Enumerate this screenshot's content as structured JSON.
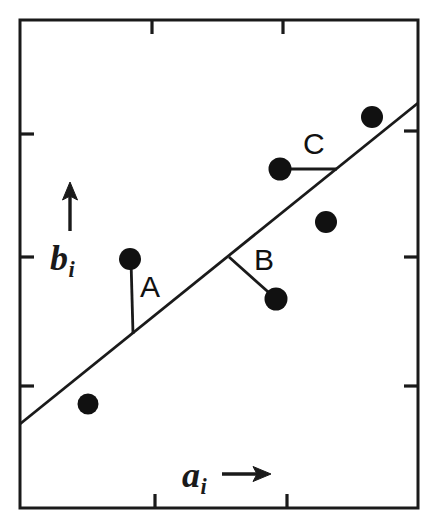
{
  "figure": {
    "title": "",
    "background_color": "#ffffff",
    "ink_color": "#1a1a1a",
    "width": 435,
    "height": 527
  },
  "axes": {
    "x_label_text": "a",
    "x_label_subscript": "i",
    "x_arrow_icon": "right-arrow-icon",
    "y_label_text": "b",
    "y_label_subscript": "i",
    "y_arrow_icon": "up-arrow-icon"
  },
  "annotations": [
    {
      "id": "A",
      "label": "A"
    },
    {
      "id": "B",
      "label": "B"
    },
    {
      "id": "C",
      "label": "C"
    }
  ],
  "chart_data": {
    "type": "scatter",
    "title": "",
    "xlabel": "a_i",
    "ylabel": "b_i",
    "grid": false,
    "legend": null,
    "axis_ticks_unlabeled": true,
    "xlim": [
      0,
      100
    ],
    "ylim": [
      0,
      100
    ],
    "x_ticks": [
      34,
      67
    ],
    "y_ticks": [
      25,
      57,
      83
    ],
    "points": [
      {
        "name": "p1",
        "x": 17.3,
        "y": 17.1,
        "px": 88,
        "py": 404
      },
      {
        "name": "p2-A-endpoint",
        "x": 27.9,
        "y": 46.7,
        "px": 130,
        "py": 259
      },
      {
        "name": "p3-B-endpoint",
        "x": 64.3,
        "y": 38.7,
        "px": 276,
        "py": 299
      },
      {
        "name": "p4-C-endpoint",
        "x": 65.3,
        "y": 65.1,
        "px": 280,
        "py": 169
      },
      {
        "name": "p5",
        "x": 76.8,
        "y": 54.3,
        "px": 326,
        "py": 222
      },
      {
        "name": "p6",
        "x": 88.3,
        "y": 75.7,
        "px": 372,
        "py": 117
      }
    ],
    "fit_line": {
      "name": "regression-line",
      "x0": 0,
      "y0": 18.0,
      "x1": 100,
      "y1": 83.5,
      "px0": 20,
      "py0": 424,
      "px1": 418,
      "py1": 103
    },
    "residual_segments": [
      {
        "label": "A",
        "kind": "vertical",
        "from": {
          "px": 131,
          "py": 260
        },
        "to": {
          "px": 133,
          "py": 334
        }
      },
      {
        "label": "B",
        "kind": "perpendicular",
        "from": {
          "px": 229,
          "py": 257
        },
        "to": {
          "px": 275,
          "py": 298
        }
      },
      {
        "label": "C",
        "kind": "horizontal",
        "from": {
          "px": 281,
          "py": 169
        },
        "to": {
          "px": 337,
          "py": 169
        }
      }
    ]
  },
  "frame": {
    "name": "plot-frame",
    "left": 20,
    "top": 20,
    "right": 418,
    "bottom": 508,
    "stroke_width": 3,
    "ticks": {
      "top": [
        152,
        283
      ],
      "bottom": [
        155,
        287
      ],
      "left": [
        134,
        257,
        386
      ],
      "right": [
        131,
        257,
        386
      ],
      "length": 14
    }
  }
}
